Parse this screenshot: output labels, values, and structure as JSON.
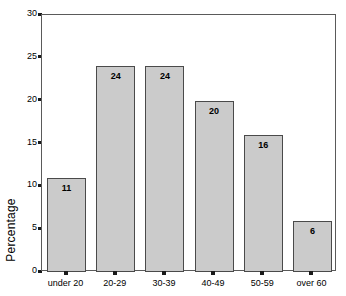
{
  "chart_data": {
    "type": "bar",
    "title": "",
    "subtitle": "",
    "xlabel": "",
    "ylabel": "Percentage",
    "categories": [
      "under 20",
      "20-29",
      "30-39",
      "40-49",
      "50-59",
      "over 60"
    ],
    "values": [
      11,
      24,
      24,
      20,
      16,
      6
    ],
    "value_labels": [
      "11",
      "24",
      "24",
      "20",
      "16",
      "6"
    ],
    "ylim": [
      0,
      30
    ],
    "y_ticks": [
      0,
      5,
      10,
      15,
      20,
      25,
      30
    ],
    "y_tick_labels": [
      "0",
      "5",
      "10",
      "15",
      "20",
      "25",
      "30"
    ],
    "grid": false,
    "legend": false,
    "legend_position": "none",
    "bar_fill_color": "#cbcbcb",
    "bar_border_color": "#4a4a4a",
    "plot_border_color": "#5a5a5a",
    "background_color": "#ffffff",
    "text_color": "#000000"
  }
}
